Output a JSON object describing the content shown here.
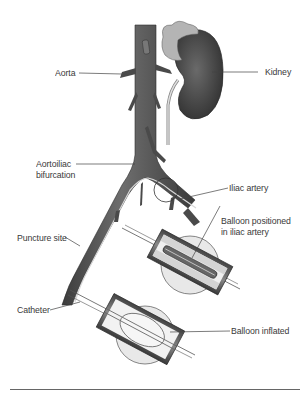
{
  "diagram": {
    "labels": {
      "aorta": "Aorta",
      "kidney": "Kidney",
      "aortoiliac_line1": "Aortoiliac",
      "aortoiliac_line2": "bifurcation",
      "iliac_artery": "Iliac artery",
      "puncture_site": "Puncture site",
      "balloon_positioned_line1": "Balloon positioned",
      "balloon_positioned_line2": "in iliac artery",
      "catheter": "Catheter",
      "balloon_inflated": "Balloon inflated"
    },
    "colors": {
      "vessel": "#5a5a5a",
      "vessel_dark": "#3a3a3a",
      "kidney": "#555555",
      "adrenal": "#b8b8b8",
      "magnifier": "#e6e6e6",
      "plaque": "#dcdcdc",
      "leader_line": "#444444",
      "text": "#3a3a3a"
    }
  }
}
